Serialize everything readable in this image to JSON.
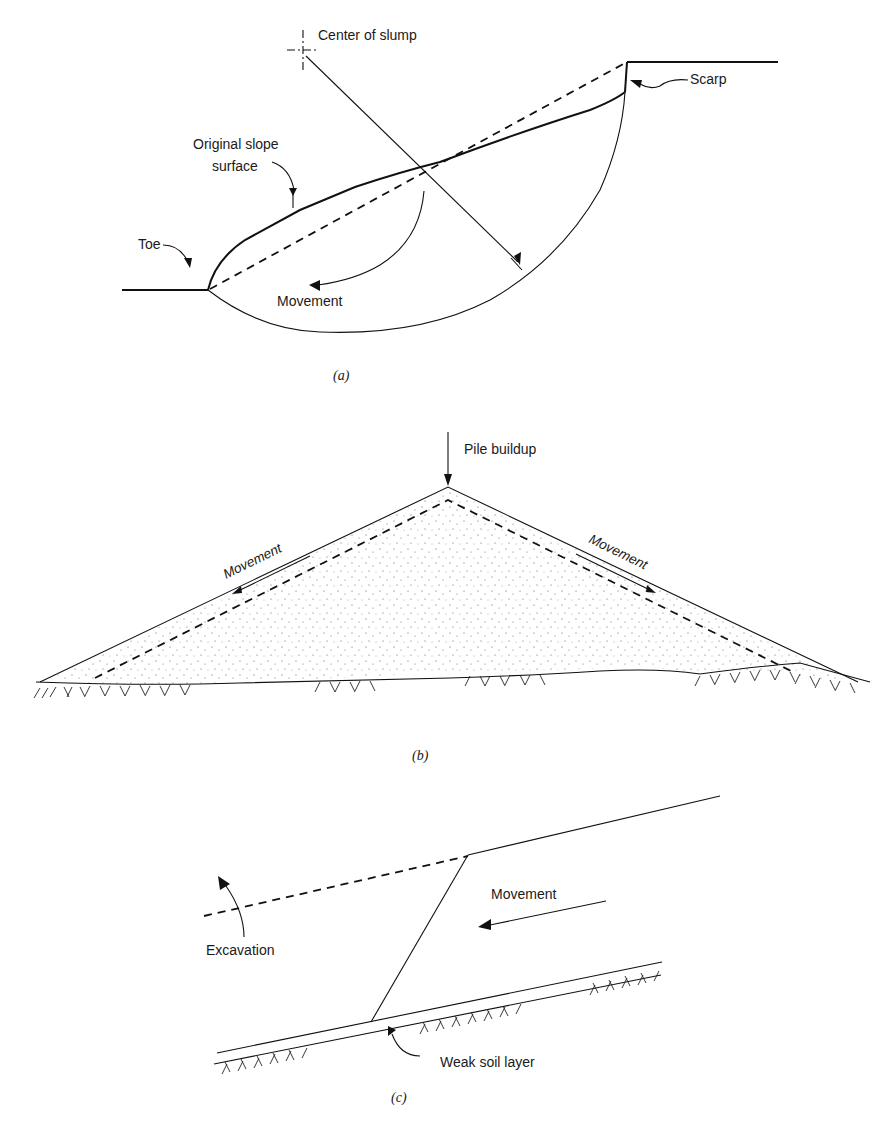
{
  "panel_a": {
    "center_label": "Center of slump",
    "scarp_label": "Scarp",
    "original_surface_label_line1": "Original slope",
    "original_surface_label_line2": "surface",
    "toe_label": "Toe",
    "movement_label": "Movement",
    "caption": "(a)"
  },
  "panel_b": {
    "pile_label": "Pile buildup",
    "movement_left_label": "Movement",
    "movement_right_label": "Movement",
    "caption": "(b)"
  },
  "panel_c": {
    "movement_label": "Movement",
    "excavation_label": "Excavation",
    "weak_layer_label": "Weak soil layer",
    "caption": "(c)"
  }
}
